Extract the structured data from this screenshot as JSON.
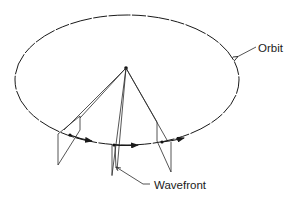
{
  "figure": {
    "type": "line-drawing",
    "labels": {
      "orbit": "Orbit",
      "wavefront": "Wavefront"
    },
    "elements": {
      "orbit_ellipse": "dashed ellipse",
      "apex": "source point at center",
      "planes": 3,
      "motion_arrows": 3
    },
    "colors": {
      "ink": "#1a1a1a",
      "background": "#ffffff"
    }
  }
}
